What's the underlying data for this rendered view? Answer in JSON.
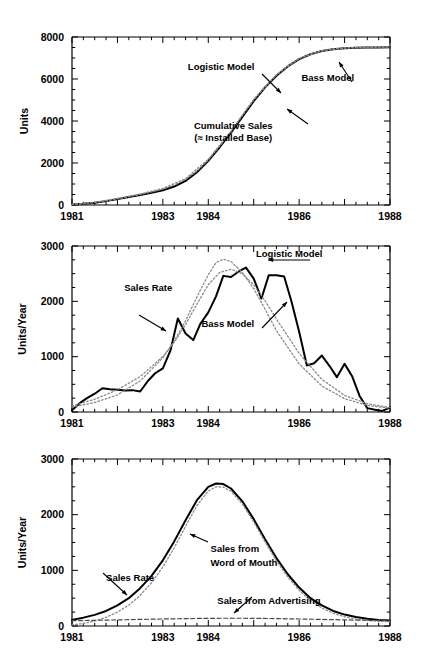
{
  "figure": {
    "background": "#ffffff",
    "ink": "#000000",
    "model_color": "#808080",
    "width": 428,
    "height": 665
  },
  "chart_data": [
    {
      "type": "line",
      "panel": "top",
      "title": "",
      "xlabel": "",
      "ylabel": "Units",
      "xlim": [
        1981,
        1988
      ],
      "ylim": [
        0,
        8000
      ],
      "xticks": [
        1981,
        1983,
        1984,
        1986,
        1988
      ],
      "xticklabels": [
        "1981",
        "1983",
        "1984",
        "1986",
        "1988"
      ],
      "yticks": [
        0,
        2000,
        4000,
        6000,
        8000
      ],
      "yticklabels": [
        "0",
        "2000",
        "4000",
        "6000",
        "8000"
      ],
      "minor_tick_step": 0.25,
      "grid": false,
      "legend": "none",
      "annotations": [
        {
          "label": "Logistic Model",
          "x": 1983.55,
          "y": 6450
        },
        {
          "label": "Bass Model",
          "x": 1986.05,
          "y": 5900
        },
        {
          "label": "Cumulative Sales",
          "x": 1984.55,
          "y": 3600
        },
        {
          "label": "(≈ Installed Base)",
          "x": 1984.55,
          "y": 3050
        }
      ],
      "series": [
        {
          "name": "Cumulative Sales",
          "style": "solid",
          "x": [
            1981.0,
            1981.25,
            1981.5,
            1981.75,
            1982.0,
            1982.25,
            1982.5,
            1982.75,
            1983.0,
            1983.25,
            1983.5,
            1983.75,
            1984.0,
            1984.25,
            1984.5,
            1984.75,
            1985.0,
            1985.25,
            1985.5,
            1985.75,
            1986.0,
            1986.25,
            1986.5,
            1986.75,
            1987.0,
            1987.25,
            1987.5,
            1987.75,
            1988.0
          ],
          "values": [
            20,
            55,
            110,
            185,
            280,
            380,
            480,
            580,
            700,
            880,
            1150,
            1560,
            2100,
            2750,
            3450,
            4200,
            4950,
            5600,
            6150,
            6600,
            6950,
            7180,
            7330,
            7420,
            7470,
            7490,
            7500,
            7505,
            7510
          ]
        },
        {
          "name": "Logistic Model",
          "style": "dotted",
          "x": [
            1981.0,
            1981.25,
            1981.5,
            1981.75,
            1982.0,
            1982.25,
            1982.5,
            1982.75,
            1983.0,
            1983.25,
            1983.5,
            1983.75,
            1984.0,
            1984.25,
            1984.5,
            1984.75,
            1985.0,
            1985.25,
            1985.5,
            1985.75,
            1986.0,
            1986.25,
            1986.5,
            1986.75,
            1987.0,
            1987.25,
            1987.5,
            1987.75,
            1988.0
          ],
          "values": [
            25,
            60,
            120,
            200,
            300,
            400,
            500,
            620,
            760,
            950,
            1220,
            1620,
            2150,
            2800,
            3520,
            4280,
            5000,
            5650,
            6200,
            6640,
            6970,
            7190,
            7340,
            7430,
            7480,
            7500,
            7510,
            7515,
            7520
          ]
        },
        {
          "name": "Bass Model",
          "style": "dotted",
          "x": [
            1981.0,
            1981.5,
            1982.0,
            1982.5,
            1983.0,
            1983.5,
            1984.0,
            1984.5,
            1985.0,
            1985.5,
            1986.0,
            1986.5,
            1987.0,
            1987.5,
            1988.0
          ],
          "values": [
            30,
            130,
            310,
            520,
            790,
            1250,
            2180,
            3500,
            5030,
            6200,
            6980,
            7340,
            7470,
            7510,
            7520
          ]
        }
      ]
    },
    {
      "type": "line",
      "panel": "middle",
      "title": "",
      "xlabel": "",
      "ylabel": "Units/Year",
      "xlim": [
        1981,
        1988
      ],
      "ylim": [
        0,
        3000
      ],
      "xticks": [
        1981,
        1983,
        1984,
        1986,
        1988
      ],
      "xticklabels": [
        "1981",
        "1983",
        "1984",
        "1986",
        "1988"
      ],
      "yticks": [
        0,
        1000,
        2000,
        3000
      ],
      "yticklabels": [
        "0",
        "1000",
        "2000",
        "3000"
      ],
      "minor_tick_step": 0.25,
      "grid": false,
      "legend": "none",
      "annotations": [
        {
          "label": "Logistic Model",
          "x": 1985.05,
          "y": 2800
        },
        {
          "label": "Sales Rate",
          "x": 1982.15,
          "y": 2180
        },
        {
          "label": "Bass Model",
          "x": 1983.85,
          "y": 1530
        }
      ],
      "series": [
        {
          "name": "Sales Rate",
          "style": "solid",
          "x": [
            1981.0,
            1981.17,
            1981.33,
            1981.5,
            1981.67,
            1981.83,
            1982.0,
            1982.17,
            1982.33,
            1982.5,
            1982.67,
            1982.83,
            1983.0,
            1983.17,
            1983.33,
            1983.5,
            1983.67,
            1983.83,
            1984.0,
            1984.17,
            1984.33,
            1984.5,
            1984.67,
            1984.83,
            1985.0,
            1985.17,
            1985.33,
            1985.5,
            1985.67,
            1985.83,
            1986.0,
            1986.17,
            1986.33,
            1986.5,
            1986.67,
            1986.83,
            1987.0,
            1987.17,
            1987.33,
            1987.5,
            1987.67,
            1987.83,
            1988.0
          ],
          "values": [
            30,
            160,
            250,
            330,
            430,
            410,
            400,
            390,
            395,
            370,
            560,
            700,
            790,
            1120,
            1690,
            1420,
            1300,
            1600,
            1800,
            2090,
            2460,
            2440,
            2540,
            2610,
            2410,
            2050,
            2470,
            2470,
            2450,
            2000,
            1450,
            840,
            880,
            1020,
            830,
            630,
            870,
            640,
            290,
            70,
            40,
            20,
            80
          ]
        },
        {
          "name": "Logistic Model",
          "style": "dotted",
          "x": [
            1981.0,
            1981.5,
            1982.0,
            1982.5,
            1983.0,
            1983.25,
            1983.5,
            1983.75,
            1984.0,
            1984.17,
            1984.33,
            1984.5,
            1984.75,
            1985.0,
            1985.25,
            1985.5,
            1986.0,
            1986.5,
            1987.0,
            1987.5,
            1988.0
          ],
          "values": [
            90,
            170,
            310,
            560,
            980,
            1280,
            1650,
            2080,
            2480,
            2700,
            2760,
            2720,
            2520,
            2230,
            1860,
            1470,
            870,
            470,
            240,
            120,
            70
          ]
        },
        {
          "name": "Bass Model",
          "style": "dotted",
          "x": [
            1981.0,
            1981.5,
            1982.0,
            1982.5,
            1983.0,
            1983.25,
            1983.5,
            1983.75,
            1984.0,
            1984.25,
            1984.5,
            1984.75,
            1985.0,
            1985.25,
            1985.5,
            1986.0,
            1986.5,
            1987.0,
            1987.5,
            1988.0
          ],
          "values": [
            110,
            230,
            400,
            640,
            1000,
            1260,
            1580,
            1950,
            2300,
            2520,
            2580,
            2500,
            2300,
            2010,
            1680,
            1060,
            590,
            300,
            150,
            80
          ]
        }
      ]
    },
    {
      "type": "line",
      "panel": "bottom",
      "title": "",
      "xlabel": "",
      "ylabel": "Units/Year",
      "xlim": [
        1981,
        1988
      ],
      "ylim": [
        0,
        3000
      ],
      "xticks": [
        1981,
        1983,
        1984,
        1986,
        1988
      ],
      "xticklabels": [
        "1981",
        "1983",
        "1984",
        "1986",
        "1988"
      ],
      "yticks": [
        0,
        1000,
        2000,
        3000
      ],
      "yticklabels": [
        "0",
        "1000",
        "2000",
        "3000"
      ],
      "minor_tick_step": 0.25,
      "grid": false,
      "legend": "none",
      "annotations": [
        {
          "label": "Sales from",
          "x": 1984.05,
          "y": 1330
        },
        {
          "label": "Word of Mouth",
          "x": 1984.05,
          "y": 1070
        },
        {
          "label": "Sales Rate",
          "x": 1981.75,
          "y": 800
        },
        {
          "label": "Sales from Advertising",
          "x": 1984.2,
          "y": 390
        }
      ],
      "series": [
        {
          "name": "Sales Rate",
          "style": "solid",
          "x": [
            1981.0,
            1981.25,
            1981.5,
            1981.75,
            1982.0,
            1982.25,
            1982.5,
            1982.75,
            1983.0,
            1983.25,
            1983.5,
            1983.75,
            1984.0,
            1984.17,
            1984.33,
            1984.5,
            1984.75,
            1985.0,
            1985.25,
            1985.5,
            1985.75,
            1986.0,
            1986.25,
            1986.5,
            1986.75,
            1987.0,
            1987.25,
            1987.5,
            1987.75,
            1988.0
          ],
          "values": [
            110,
            150,
            200,
            270,
            370,
            500,
            680,
            900,
            1180,
            1520,
            1900,
            2260,
            2500,
            2560,
            2550,
            2470,
            2240,
            1920,
            1560,
            1220,
            930,
            690,
            500,
            370,
            270,
            205,
            160,
            130,
            110,
            100
          ]
        },
        {
          "name": "Sales from Word of Mouth",
          "style": "dotted",
          "x": [
            1981.0,
            1981.25,
            1981.5,
            1981.75,
            1982.0,
            1982.25,
            1982.5,
            1982.75,
            1983.0,
            1983.25,
            1983.5,
            1983.75,
            1984.0,
            1984.17,
            1984.33,
            1984.5,
            1984.75,
            1985.0,
            1985.25,
            1985.5,
            1985.75,
            1986.0,
            1986.25,
            1986.5,
            1986.75,
            1987.0,
            1987.25,
            1987.5,
            1987.75,
            1988.0
          ],
          "values": [
            20,
            45,
            90,
            155,
            250,
            375,
            550,
            775,
            1060,
            1405,
            1790,
            2165,
            2425,
            2500,
            2495,
            2420,
            2190,
            1870,
            1510,
            1170,
            880,
            640,
            455,
            325,
            230,
            165,
            125,
            100,
            85,
            75
          ]
        },
        {
          "name": "Sales from Advertising",
          "style": "dashed",
          "x": [
            1981.0,
            1981.5,
            1982.0,
            1982.5,
            1983.0,
            1983.5,
            1984.0,
            1984.5,
            1985.0,
            1985.5,
            1986.0,
            1986.5,
            1987.0,
            1987.5,
            1988.0
          ],
          "values": [
            95,
            102,
            110,
            118,
            126,
            133,
            138,
            140,
            138,
            133,
            126,
            118,
            110,
            103,
            98
          ]
        }
      ]
    }
  ]
}
